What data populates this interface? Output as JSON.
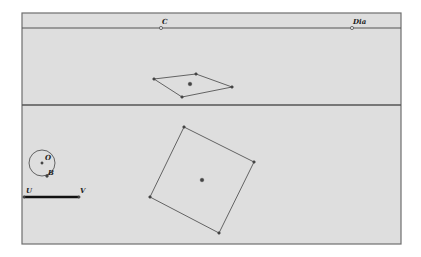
{
  "colors": {
    "background": "#ffffff",
    "panel": "#dedede",
    "frame": "#6e6e6e",
    "line": "#555555",
    "point": "#444444",
    "segment": "#111111"
  },
  "frame": {
    "x": 22,
    "y": 13,
    "w": 379,
    "h": 231
  },
  "top_line": {
    "y": 28,
    "points": [
      {
        "label": "C",
        "x": 161,
        "y": 28
      },
      {
        "label": "Dia",
        "x": 352,
        "y": 28
      }
    ]
  },
  "divider": {
    "y": 105
  },
  "rhombus": {
    "vertices": [
      [
        154,
        79
      ],
      [
        196,
        74
      ],
      [
        232,
        87
      ],
      [
        182,
        97
      ]
    ],
    "center": [
      190,
      84
    ]
  },
  "square": {
    "vertices": [
      [
        184,
        127
      ],
      [
        254,
        162
      ],
      [
        219,
        233
      ],
      [
        150,
        197
      ]
    ],
    "center": [
      202,
      180
    ]
  },
  "circle": {
    "center": [
      42,
      163
    ],
    "radius": 13,
    "center_label": "O",
    "point_label": "B",
    "point": [
      47,
      176
    ]
  },
  "segment": {
    "start": [
      24,
      197
    ],
    "end": [
      79,
      197
    ],
    "start_label": "U",
    "end_label": "V"
  }
}
